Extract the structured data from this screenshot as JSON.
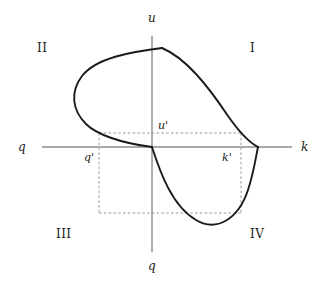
{
  "figure": {
    "title": "",
    "background_color": "#ffffff",
    "axis_color": "#8c8c8c",
    "curve_color": "#1a1a1a",
    "dash_color": "#9a9a9a"
  },
  "axes": {
    "vertical_top_label": "u",
    "vertical_bottom_label": "q",
    "horizontal_left_label": "q",
    "horizontal_right_label": "k"
  },
  "quadrants": [
    {
      "label": "I"
    },
    {
      "label": "II"
    },
    {
      "label": "III"
    },
    {
      "label": "IV"
    }
  ],
  "markers": [
    {
      "label": "u'"
    },
    {
      "label": "q'"
    },
    {
      "label": "k'"
    }
  ],
  "chart_data": {
    "type": "line",
    "title": "",
    "xlabel": "k",
    "ylabel": "u",
    "grid": false,
    "legend": null,
    "annotations": [
      "I",
      "II",
      "III",
      "IV",
      "u'",
      "q'",
      "k'"
    ],
    "series": [
      {
        "name": "upper-left-loop",
        "path": "M 162 48 C 130 52, 96 58, 82 76 C 70 92, 72 110, 86 124 C 96 134, 120 143, 152 147"
      },
      {
        "name": "upper-right-branch",
        "path": "M 162 48 C 186 58, 208 86, 228 116 C 240 133, 250 143, 258 147"
      },
      {
        "name": "lower-branch",
        "path": "M 152 147 C 160 172, 172 206, 196 220 C 216 232, 238 220, 248 190 C 254 172, 256 156, 258 147"
      }
    ],
    "dashed_guides": [
      {
        "name": "u-prime-horizontal",
        "x1": 99,
        "y1": 133,
        "x2": 241,
        "y2": 133
      },
      {
        "name": "q-prime-vertical",
        "x1": 99,
        "y1": 133,
        "x2": 99,
        "y2": 213
      },
      {
        "name": "lower-horizontal",
        "x1": 99,
        "y1": 213,
        "x2": 241,
        "y2": 213
      },
      {
        "name": "k-prime-vertical",
        "x1": 241,
        "y1": 133,
        "x2": 241,
        "y2": 213
      }
    ]
  }
}
